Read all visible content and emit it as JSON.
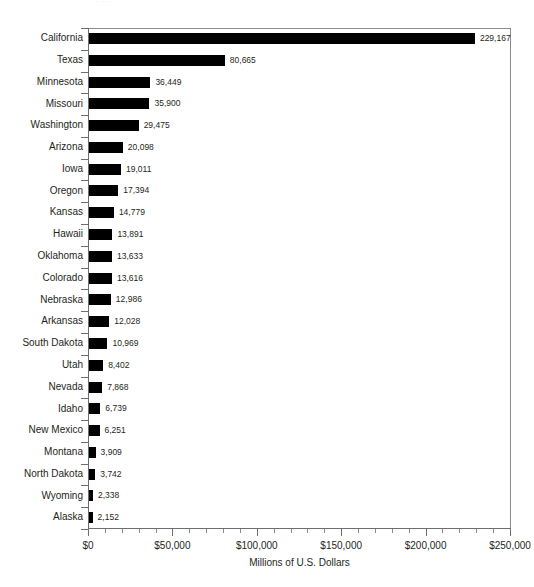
{
  "chart": {
    "title_remnant": "·  ·  ·",
    "axis_title": "Millions of U.S. Dollars"
  },
  "chart_data": {
    "type": "bar",
    "orientation": "horizontal",
    "title": "",
    "xlabel": "Millions of U.S. Dollars",
    "ylabel": "",
    "xlim": [
      0,
      250000
    ],
    "grid": false,
    "legend": null,
    "bar_color": "#000000",
    "axis_color": "#6e6e6e",
    "text_color": "#231f20",
    "x_major_step": 50000,
    "x_minor_step": 10000,
    "xticklabels": [
      "$0",
      "$50,000",
      "$100,000",
      "$150,000",
      "$200,000",
      "$250,000"
    ],
    "xtickvalues": [
      0,
      50000,
      100000,
      150000,
      200000,
      250000
    ],
    "categories": [
      "California",
      "Texas",
      "Minnesota",
      "Missouri",
      "Washington",
      "Arizona",
      "Iowa",
      "Oregon",
      "Kansas",
      "Hawaii",
      "Oklahoma",
      "Colorado",
      "Nebraska",
      "Arkansas",
      "South Dakota",
      "Utah",
      "Nevada",
      "Idaho",
      "New Mexico",
      "Montana",
      "North Dakota",
      "Wyoming",
      "Alaska"
    ],
    "values": [
      229167,
      80665,
      36449,
      35900,
      29475,
      20098,
      19011,
      17394,
      14779,
      13891,
      13633,
      13616,
      12986,
      12028,
      10969,
      8402,
      7868,
      6739,
      6251,
      3909,
      3742,
      2338,
      2152
    ],
    "value_labels": [
      "229,167",
      "80,665",
      "36,449",
      "35,900",
      "29,475",
      "20,098",
      "19,011",
      "17,394",
      "14,779",
      "13,891",
      "13,633",
      "13,616",
      "12,986",
      "12,028",
      "10,969",
      "8,402",
      "7,868",
      "6,739",
      "6,251",
      "3,909",
      "3,742",
      "2,338",
      "2,152"
    ]
  }
}
